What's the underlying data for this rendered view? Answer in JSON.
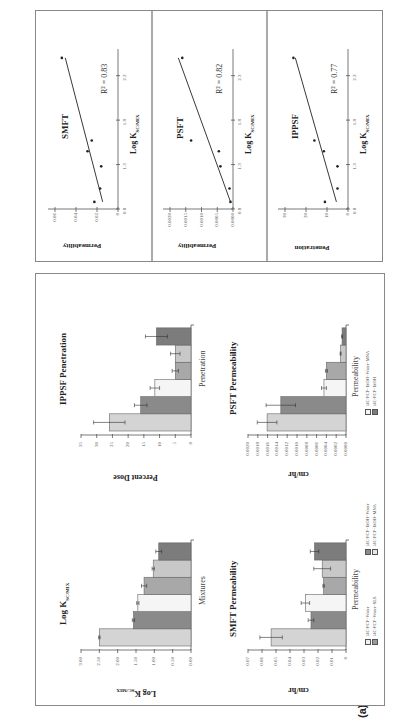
{
  "figure": {
    "panel_a_label": "(a)",
    "panel_b_label": "(b)",
    "colors": {
      "light_gray": "#d4d4d4",
      "dark_gray": "#8a8a8a",
      "white": "#f5f5f5",
      "medium_gray": "#a8a8a8",
      "pale_gray": "#c8c8c8",
      "darker_gray": "#7c7c7c"
    },
    "legend": [
      {
        "label": "14C-PCP+Water",
        "swatch": "#f0f0f0"
      },
      {
        "label": "14C-PCP+Water+SLS",
        "swatch": "#9a9a9a"
      },
      {
        "label": "14C-PCP+EtOH+Water",
        "swatch": "#8a8a8a"
      },
      {
        "label": "14C-PCP+EtOH+MNA",
        "swatch": "#e6e6e6"
      },
      {
        "label": "14C-PCP+EtOH+Water+MNA",
        "swatch": "#f5f5f5"
      },
      {
        "label": "14C-PCP+EtOH",
        "swatch": "#7c7c7c"
      }
    ],
    "log_k": {
      "title": "Log K",
      "title_sub": "SC/MIX",
      "ylabel": "Log K",
      "ylabel_sub": "SC/MIX",
      "xlabel": "Mixtures",
      "ticks": [
        "0.00",
        "0.50",
        "1.00",
        "1.50",
        "2.00",
        "2.50",
        "3.00"
      ]
    },
    "ippsf_pen": {
      "title": "IPPSF Penetration",
      "ylabel": "Percent Dose",
      "xlabel": "Penetration",
      "ticks": [
        "0",
        "5",
        "10",
        "15",
        "20",
        "25",
        "30",
        "35"
      ]
    },
    "smft_perm": {
      "title": "SMFT Permeability",
      "ylabel": "cm/hr",
      "xlabel": "Permeability",
      "ticks": [
        "0",
        "0.01",
        "0.02",
        "0.03",
        "0.04",
        "0.05",
        "0.06",
        "0.07"
      ]
    },
    "psft_perm": {
      "title": "PSFT Permeability",
      "ylabel": "cm/hr",
      "xlabel": "Permeability",
      "ticks": [
        "0.0000",
        "0.0002",
        "0.0004",
        "0.0006",
        "0.0008",
        "0.0010",
        "0.0012",
        "0.0014",
        "0.0016",
        "0.0018",
        "0.0020"
      ]
    },
    "smft_scatter": {
      "title": "SMFT",
      "ylabel": "Permeability",
      "xlabel": "Log K",
      "xlabel_sub": "SC/MIX",
      "r2": "R² = 0.83",
      "yticks": [
        "0",
        "0.02",
        "0.04",
        "0.06"
      ],
      "xticks": [
        "0.8",
        "1.3",
        "1.8",
        "2.3"
      ]
    },
    "psft_scatter": {
      "title": "PSFT",
      "ylabel": "Permeability",
      "xlabel": "Log K",
      "xlabel_sub": "SC/MIX",
      "r2": "R² = 0.82",
      "yticks": [
        "0.0000",
        "0.0005",
        "0.0010",
        "0.0015",
        "0.0020"
      ],
      "xticks": [
        "0.8",
        "1.3",
        "1.8",
        "2.3"
      ]
    },
    "ippsf_scatter": {
      "title": "IPPSF",
      "ylabel": "Penetration",
      "xlabel": "Log K",
      "xlabel_sub": "SC/MIX",
      "r2": "R² = 0.77",
      "yticks": [
        "0",
        "10",
        "20",
        "30"
      ],
      "xticks": [
        "0.8",
        "1.3",
        "1.8",
        "2.3"
      ]
    }
  },
  "chart_data": [
    {
      "type": "bar",
      "title": "Log K SC/MIX",
      "xlabel": "Mixtures",
      "ylabel": "Log K SC/MIX",
      "ylim": [
        0,
        3.0
      ],
      "categories": [
        "14C-PCP+Water",
        "14C-PCP+Water+SLS",
        "14C-PCP+EtOH+Water",
        "14C-PCP+EtOH+MNA",
        "14C-PCP+EtOH+Water+MNA",
        "14C-PCP+EtOH"
      ],
      "values": [
        2.5,
        1.57,
        1.45,
        1.28,
        1.03,
        0.88
      ],
      "errors": [
        0.02,
        0.03,
        0.03,
        0.07,
        0.03,
        0.08
      ]
    },
    {
      "type": "bar",
      "title": "IPPSF Penetration",
      "xlabel": "Penetration",
      "ylabel": "Percent Dose",
      "ylim": [
        0,
        35
      ],
      "categories": [
        "14C-PCP+Water",
        "14C-PCP+Water+SLS",
        "14C-PCP+EtOH+Water",
        "14C-PCP+EtOH+MNA",
        "14C-PCP+EtOH+Water+MNA",
        "14C-PCP+EtOH"
      ],
      "values": [
        26,
        16,
        11.5,
        5,
        5,
        11
      ],
      "errors": [
        5,
        2,
        1.5,
        1,
        1.5,
        3.5
      ]
    },
    {
      "type": "bar",
      "title": "SMFT Permeability",
      "xlabel": "Permeability",
      "ylabel": "cm/hr",
      "ylim": [
        0,
        0.07
      ],
      "categories": [
        "14C-PCP+Water",
        "14C-PCP+Water+SLS",
        "14C-PCP+EtOH+Water",
        "14C-PCP+EtOH+MNA",
        "14C-PCP+EtOH+Water+MNA",
        "14C-PCP+EtOH"
      ],
      "values": [
        0.0535,
        0.025,
        0.029,
        0.016,
        0.017,
        0.0225
      ],
      "errors": [
        0.008,
        0.002,
        0.003,
        0.0005,
        0.006,
        0.003
      ]
    },
    {
      "type": "bar",
      "title": "PSFT Permeability",
      "xlabel": "Permeability",
      "ylabel": "cm/hr",
      "ylim": [
        0,
        0.002
      ],
      "categories": [
        "14C-PCP+Water",
        "14C-PCP+Water+SLS",
        "14C-PCP+EtOH+Water",
        "14C-PCP+EtOH+MNA",
        "14C-PCP+EtOH+Water+MNA",
        "14C-PCP+EtOH"
      ],
      "values": [
        0.00161,
        0.00133,
        0.00045,
        0.0004,
        0.00011,
        8e-05
      ],
      "errors": [
        0.0002,
        0.0003,
        5e-05,
        2e-05,
        1e-05,
        1e-05
      ]
    },
    {
      "type": "scatter",
      "title": "SMFT",
      "xlabel": "Log K SC/MIX",
      "ylabel": "Permeability",
      "xlim": [
        0.8,
        2.6
      ],
      "ylim": [
        0,
        0.06
      ],
      "x": [
        0.88,
        1.03,
        1.28,
        1.45,
        1.57,
        2.5
      ],
      "y": [
        0.0225,
        0.017,
        0.016,
        0.029,
        0.025,
        0.0535
      ],
      "annotation": "R² = 0.83",
      "trendline": true
    },
    {
      "type": "scatter",
      "title": "PSFT",
      "xlabel": "Log K SC/MIX",
      "ylabel": "Permeability",
      "xlim": [
        0.8,
        2.6
      ],
      "ylim": [
        0,
        0.002
      ],
      "x": [
        0.88,
        1.03,
        1.28,
        1.45,
        1.57,
        2.5
      ],
      "y": [
        8e-05,
        0.00011,
        0.0004,
        0.00045,
        0.00133,
        0.00161
      ],
      "annotation": "R² = 0.82",
      "trendline": true
    },
    {
      "type": "scatter",
      "title": "IPPSF",
      "xlabel": "Log K SC/MIX",
      "ylabel": "Penetration",
      "xlim": [
        0.8,
        2.6
      ],
      "ylim": [
        0,
        30
      ],
      "x": [
        0.88,
        1.03,
        1.28,
        1.45,
        1.57,
        2.5
      ],
      "y": [
        11,
        5,
        5,
        11.5,
        16,
        26
      ],
      "annotation": "R² = 0.77",
      "trendline": true
    }
  ]
}
